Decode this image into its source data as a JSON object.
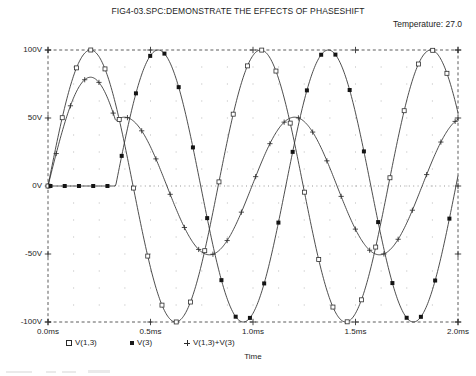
{
  "title": "FIG4-03.SPC:DEMONSTRATE THE EFFECTS OF PHASESHIFT",
  "temperature_label": "Temperature:  27.0",
  "axis_title_x": "Time",
  "legend": [
    {
      "marker": "open-square-marker",
      "label": "V(1,3)"
    },
    {
      "marker": "filled-square-marker",
      "label": "V(3)"
    },
    {
      "marker": "plus-marker",
      "label": "V(1,3)+V(3)"
    }
  ],
  "chart_data": {
    "type": "line",
    "title": "FIG4-03.SPC:DEMONSTRATE THE EFFECTS OF PHASESHIFT",
    "subtitle": "Temperature:  27.0",
    "xlabel": "Time",
    "ylabel": "",
    "xlim": [
      0.0,
      2.0
    ],
    "ylim": [
      -100,
      100
    ],
    "x_unit": "ms",
    "y_unit": "V",
    "xticks": [
      0.0,
      0.5,
      1.0,
      1.5,
      2.0
    ],
    "xticklabels": [
      "0.0ms",
      "0.5ms",
      "1.0ms",
      "1.5ms",
      "2.0ms"
    ],
    "yticks": [
      -100,
      -50,
      0,
      50,
      100
    ],
    "yticklabels": [
      "-100V",
      "-50V",
      "0V",
      "50V",
      "100V"
    ],
    "grid": true,
    "grid_style": "dotted-interior-dashed-border",
    "legend_position": "below-axis",
    "series": [
      {
        "name": "V(1,3)",
        "marker": "open-square-marker",
        "waveform": "sine",
        "amplitude": 100,
        "period_ms": 0.83,
        "phase_deg": 0,
        "offset": 0,
        "start_ms": 0.0
      },
      {
        "name": "V(3)",
        "marker": "filled-square-marker",
        "waveform": "sine-delayed",
        "amplitude": 100,
        "period_ms": 0.83,
        "phase_deg": 0,
        "offset": 0,
        "start_ms": 0.33,
        "note": "flat at 0V until 0.33ms"
      },
      {
        "name": "V(1,3)+V(3)",
        "marker": "plus-marker",
        "waveform": "sum",
        "amplitude": 80,
        "period_ms": 0.83,
        "phase_deg": 0,
        "offset": 0,
        "start_ms": 0.0,
        "note": "sum of V(1,3) and V(3)"
      }
    ]
  }
}
